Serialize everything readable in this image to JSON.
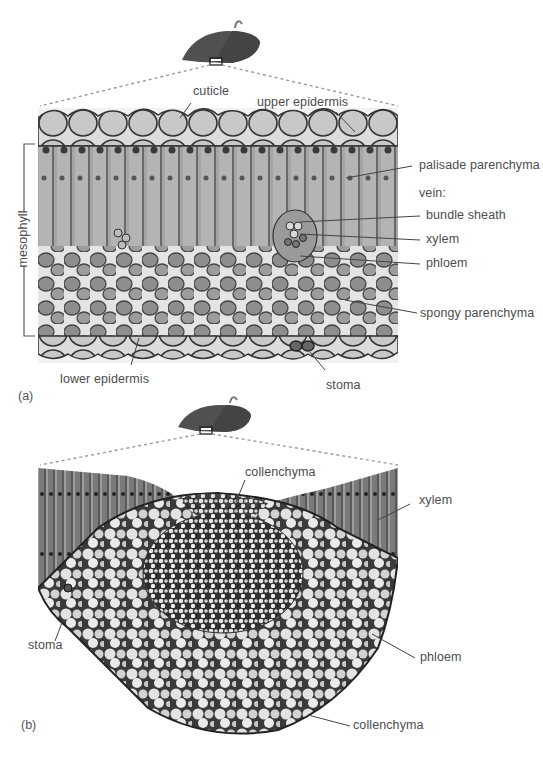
{
  "figure": {
    "panels": [
      {
        "id": "a",
        "letter": "(a)",
        "bracket_label": "mesophyll",
        "labels": {
          "cuticle": "cuticle",
          "upper_epidermis": "upper epidermis",
          "palisade_parenchyma": "palisade parenchyma",
          "vein_heading": "vein:",
          "bundle_sheath": "bundle sheath",
          "xylem": "xylem",
          "phloem": "phloem",
          "spongy_parenchyma": "spongy parenchyma",
          "lower_epidermis": "lower epidermis",
          "stoma": "stoma"
        }
      },
      {
        "id": "b",
        "letter": "(b)",
        "labels": {
          "collenchyma_top": "collenchyma",
          "xylem": "xylem",
          "stoma": "stoma",
          "phloem": "phloem",
          "collenchyma_bottom": "collenchyma"
        }
      }
    ],
    "colors": {
      "leaf_dark": "#4a4a4a",
      "leaf_light": "#5e5e5e",
      "label_text": "#4d4d4d",
      "leader_line": "#555555",
      "dashed_line": "#9a9a9a",
      "micrograph_base": "#b8b8b8"
    }
  }
}
